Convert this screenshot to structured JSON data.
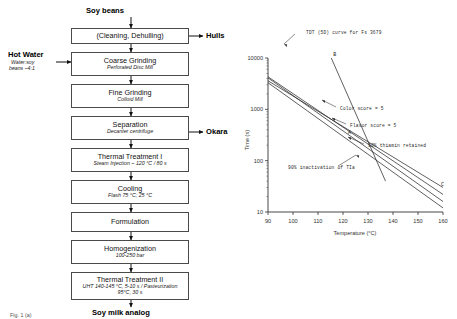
{
  "flowchart": {
    "input_label": "Soy beans",
    "output_label": "Soy milk analog",
    "side_inputs": [
      {
        "title": "Hot Water",
        "sub_line1": "Water:soy",
        "sub_line2": "beans ~4:1"
      }
    ],
    "side_outputs": [
      {
        "label": "Hulls"
      },
      {
        "label": "Okara"
      }
    ],
    "steps": [
      {
        "title": "(Cleaning, Dehulling)",
        "sub": ""
      },
      {
        "title": "Coarse Grinding",
        "sub": "Perforated Disc Mill"
      },
      {
        "title": "Fine Grinding",
        "sub": "Colloid Mill"
      },
      {
        "title": "Separation",
        "sub": "Decanter centrifuge"
      },
      {
        "title": "Thermal Treatment I",
        "sub": "Steam Injection ~ 120 °C / 80 s"
      },
      {
        "title": "Cooling",
        "sub": "Flash 75 °C; 25 °C"
      },
      {
        "title": "Formulation",
        "sub": ""
      },
      {
        "title": "Homogenization",
        "sub": "100-250 bar"
      },
      {
        "title": "Thermal Treatment II",
        "sub": "UHT 140-145 °C, 5-10 s / Pasteurization",
        "sub2": "95°C, 30 s"
      }
    ],
    "caption": "Fig. 1 (a)"
  },
  "chart_data": {
    "type": "line",
    "title": "",
    "xlabel": "Temperature (°C)",
    "ylabel": "Time (s)",
    "xlim": [
      90,
      160
    ],
    "ylim": [
      10,
      10000
    ],
    "yscale": "log",
    "xticks": [
      90,
      100,
      110,
      120,
      130,
      140,
      150,
      160
    ],
    "yticks": [
      10,
      100,
      1000,
      10000
    ],
    "ytick_labels": [
      "10",
      "100",
      "1000",
      "10000"
    ],
    "grid": false,
    "legend": "none",
    "series": [
      {
        "name": "TDT (5D) curve for Fs 3679",
        "point_label": "B",
        "x": [
          113,
          137
        ],
        "y": [
          18000,
          40
        ]
      },
      {
        "name": "Color score = 5",
        "point_label": "",
        "x": [
          90,
          160
        ],
        "y": [
          4300,
          22
        ]
      },
      {
        "name": "Flavor score = 5",
        "point_label": "",
        "x": [
          90,
          160
        ],
        "y": [
          4100,
          16
        ]
      },
      {
        "name": "90% thiamin retained",
        "point_label": "C",
        "x": [
          90,
          160
        ],
        "y": [
          3600,
          30
        ]
      },
      {
        "name": "90% inactivation of TIa",
        "point_label": "A",
        "x": [
          90,
          160
        ],
        "y": [
          3300,
          12
        ]
      }
    ],
    "annotations": [
      {
        "text": "TDT (5D) curve for Fs 3679"
      },
      {
        "text": "Color score = 5"
      },
      {
        "text": "Flavor score = 5"
      },
      {
        "text": "90% thiamin retained"
      },
      {
        "text": "90% inactivation of TIa"
      }
    ],
    "point_labels": [
      "A",
      "B",
      "C"
    ]
  }
}
